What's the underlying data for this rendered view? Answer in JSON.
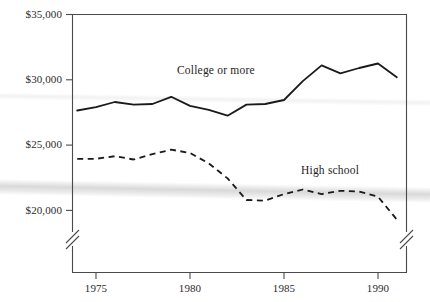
{
  "chart_data": {
    "type": "line",
    "title": "",
    "subtitle": "",
    "xlabel": "",
    "ylabel": "",
    "xlim": [
      1974,
      1991
    ],
    "ylim": [
      20000,
      35000
    ],
    "y_axis_broken": true,
    "grid": false,
    "legend": "inline-annotations",
    "y_ticks": [
      {
        "value": 20000,
        "label": "$20,000"
      },
      {
        "value": 25000,
        "label": "$25,000"
      },
      {
        "value": 30000,
        "label": "$30,000"
      },
      {
        "value": 35000,
        "label": "$35,000"
      }
    ],
    "x_ticks": [
      {
        "value": 1975,
        "label": "1975"
      },
      {
        "value": 1980,
        "label": "1980"
      },
      {
        "value": 1985,
        "label": "1985"
      },
      {
        "value": 1990,
        "label": "1990"
      }
    ],
    "x": [
      1974,
      1975,
      1976,
      1977,
      1978,
      1979,
      1980,
      1981,
      1982,
      1983,
      1984,
      1985,
      1986,
      1987,
      1988,
      1989,
      1990,
      1991
    ],
    "series": [
      {
        "name": "College or more",
        "style": "solid",
        "color": "#1a1a1a",
        "values": [
          27650,
          27900,
          28300,
          28100,
          28150,
          28700,
          28000,
          27700,
          27250,
          28100,
          28150,
          28450,
          29900,
          31100,
          30500,
          30900,
          31250,
          30200
        ]
      },
      {
        "name": "High school",
        "style": "dashed",
        "color": "#1a1a1a",
        "values": [
          23950,
          23950,
          24150,
          23900,
          24300,
          24650,
          24400,
          23600,
          22450,
          20800,
          20750,
          21250,
          21600,
          21250,
          21500,
          21450,
          21050,
          19300
        ]
      }
    ],
    "annotations": [
      {
        "text": "College or more",
        "x": 1979.6,
        "y": 30000
      },
      {
        "text": "High school",
        "x": 1987.3,
        "y": 22850
      }
    ]
  },
  "labels": {
    "y0": "$20,000",
    "y1": "$25,000",
    "y2": "$30,000",
    "y3": "$35,000",
    "x0": "1975",
    "x1": "1980",
    "x2": "1985",
    "x3": "1990",
    "series_college": "College or more",
    "series_highschool": "High school"
  }
}
